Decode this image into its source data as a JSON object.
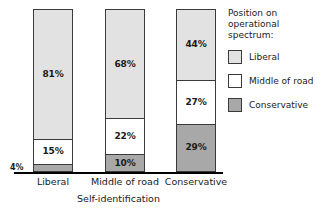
{
  "chart_data": {
    "type": "bar",
    "subtype": "100% stacked bar",
    "title": "",
    "xlabel": "Self-identification",
    "ylabel": "",
    "ylim": [
      0,
      100
    ],
    "grid": false,
    "legend_position": "right",
    "legend_title": "Position on\noperational\nspectrum:",
    "categories": [
      "Liberal",
      "Middle of road",
      "Conservative"
    ],
    "series": [
      {
        "name": "Liberal",
        "color": "#e2e2e2",
        "values": [
          81,
          68,
          44
        ],
        "labels": [
          "81%",
          "68%",
          "44%"
        ]
      },
      {
        "name": "Middle of road",
        "color": "#ffffff",
        "values": [
          15,
          22,
          27
        ],
        "labels": [
          "15%",
          "22%",
          "27%"
        ]
      },
      {
        "name": "Conservative",
        "color": "#a8a8a8",
        "values": [
          4,
          10,
          29
        ],
        "labels": [
          "4%",
          "10%",
          "29%"
        ]
      }
    ]
  },
  "legend": {
    "title": "Position on\noperational\nspectrum:",
    "items": [
      {
        "label": "Liberal",
        "color": "#e2e2e2"
      },
      {
        "label": "Middle of road",
        "color": "#ffffff"
      },
      {
        "label": "Conservative",
        "color": "#a8a8a8"
      }
    ]
  },
  "axis": {
    "title": "Self-identification",
    "categories": [
      "Liberal",
      "Middle of road",
      "Conservative"
    ]
  },
  "bars": [
    {
      "category": "Liberal",
      "segments": [
        {
          "name": "Liberal",
          "label": "81%",
          "value": 81
        },
        {
          "name": "Middle of road",
          "label": "15%",
          "value": 15
        },
        {
          "name": "Conservative",
          "label": "4%",
          "value": 4
        }
      ]
    },
    {
      "category": "Middle of road",
      "segments": [
        {
          "name": "Liberal",
          "label": "68%",
          "value": 68
        },
        {
          "name": "Middle of road",
          "label": "22%",
          "value": 22
        },
        {
          "name": "Conservative",
          "label": "10%",
          "value": 10
        }
      ]
    },
    {
      "category": "Conservative",
      "segments": [
        {
          "name": "Liberal",
          "label": "44%",
          "value": 44
        },
        {
          "name": "Middle of road",
          "label": "27%",
          "value": 27
        },
        {
          "name": "Conservative",
          "label": "29%",
          "value": 29
        }
      ]
    }
  ]
}
